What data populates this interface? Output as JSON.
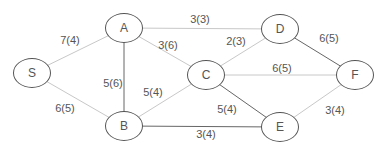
{
  "graph": {
    "nodes": [
      {
        "id": "S",
        "label": "S",
        "x": 32,
        "y": 73
      },
      {
        "id": "A",
        "label": "A",
        "x": 124,
        "y": 28
      },
      {
        "id": "B",
        "label": "B",
        "x": 124,
        "y": 126
      },
      {
        "id": "C",
        "label": "C",
        "x": 206,
        "y": 75
      },
      {
        "id": "D",
        "label": "D",
        "x": 280,
        "y": 29
      },
      {
        "id": "E",
        "label": "E",
        "x": 280,
        "y": 127
      },
      {
        "id": "F",
        "label": "F",
        "x": 355,
        "y": 75
      }
    ],
    "edges": [
      {
        "from": "S",
        "to": "A",
        "label": "7(4)",
        "lx": 70,
        "ly": 40,
        "color": "#c8c8c8"
      },
      {
        "from": "S",
        "to": "B",
        "label": "6(5)",
        "lx": 65,
        "ly": 108,
        "color": "#c8c8c8"
      },
      {
        "from": "A",
        "to": "D",
        "label": "3(3)",
        "lx": 200,
        "ly": 19,
        "color": "#c8c8c8"
      },
      {
        "from": "A",
        "to": "C",
        "label": "3(6)",
        "lx": 168,
        "ly": 45,
        "color": "#c8c8c8"
      },
      {
        "from": "A",
        "to": "B",
        "label": "5(6)",
        "lx": 113,
        "ly": 83,
        "color": "#666666"
      },
      {
        "from": "B",
        "to": "C",
        "label": "5(4)",
        "lx": 153,
        "ly": 92,
        "color": "#c8c8c8"
      },
      {
        "from": "B",
        "to": "E",
        "label": "3(4)",
        "lx": 206,
        "ly": 134,
        "color": "#666666"
      },
      {
        "from": "C",
        "to": "D",
        "label": "2(3)",
        "lx": 236,
        "ly": 41,
        "color": "#c8c8c8"
      },
      {
        "from": "C",
        "to": "F",
        "label": "6(5)",
        "lx": 282,
        "ly": 68,
        "color": "#c8c8c8"
      },
      {
        "from": "C",
        "to": "E",
        "label": "5(4)",
        "lx": 227,
        "ly": 109,
        "color": "#666666"
      },
      {
        "from": "D",
        "to": "F",
        "label": "6(5)",
        "lx": 329,
        "ly": 38,
        "color": "#666666"
      },
      {
        "from": "E",
        "to": "F",
        "label": "3(4)",
        "lx": 335,
        "ly": 110,
        "color": "#c8c8c8"
      }
    ]
  }
}
